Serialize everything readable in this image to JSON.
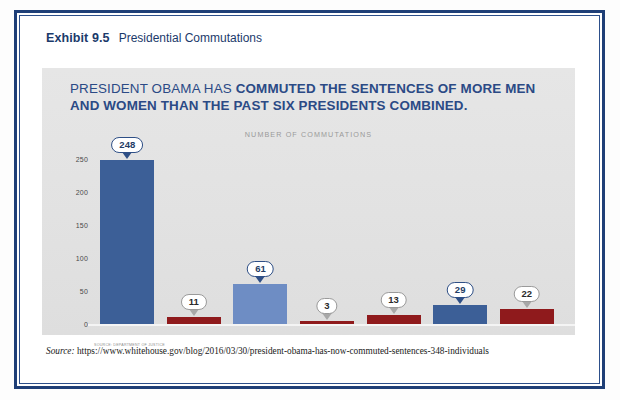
{
  "exhibit": {
    "label": "Exhibit 9.5",
    "title": "Presidential Commutations"
  },
  "headline": {
    "light_part": "PRESIDENT OBAMA HAS ",
    "bold_part": "COMMUTED THE SENTENCES OF MORE MEN AND WOMEN THAN THE PAST SIX PRESIDENTS COMBINED."
  },
  "footer": {
    "source_word": "Source:",
    "source_url": "https://www.whitehouse.gov/blog/2016/03/30/president-obama-has-now-commuted-sentences-348-individuals"
  },
  "colors": {
    "frame_navy": "#1f3f77",
    "headline_blue": "#2b4a85",
    "obama_blue": "#3c5f97",
    "clinton_blue": "#6e8dc4",
    "carter_blue": "#3c5f97",
    "republican_red": "#8f1a1c",
    "panel_gray": "#e4e4e4"
  },
  "chart_data": {
    "type": "bar",
    "title": "PRESIDENT OBAMA HAS COMMUTED THE SENTENCES OF MORE MEN AND WOMEN THAN THE PAST SIX PRESIDENTS COMBINED.",
    "subtitle": "NUMBER OF COMMUTATIONS",
    "source_note": "SOURCE: DEPARTMENT OF JUSTICE",
    "xlabel": "",
    "ylabel": "",
    "ylim": [
      0,
      260
    ],
    "yticks": [
      0,
      50,
      100,
      150,
      200,
      250
    ],
    "ytick_labels": [
      "0",
      "50",
      "100",
      "150",
      "200",
      "250"
    ],
    "grid": false,
    "legend": "none",
    "categories": [
      "OBAMA",
      "BUSH 43",
      "CLINTON",
      "BUSH 41",
      "REAGAN",
      "CARTER",
      "FORD"
    ],
    "values": [
      248,
      11,
      61,
      3,
      13,
      29,
      22
    ],
    "value_labels": [
      "248",
      "11",
      "61",
      "3",
      "13",
      "29",
      "22"
    ],
    "bar_colors": [
      "#3c5f97",
      "#8f1a1c",
      "#6e8dc4",
      "#8f1a1c",
      "#8f1a1c",
      "#3c5f97",
      "#8f1a1c"
    ],
    "label_colors": [
      "#2b4a85",
      "#8f1a1c",
      "#2b4a85",
      "#8f1a1c",
      "#8f1a1c",
      "#2b4a85",
      "#8f1a1c"
    ],
    "bubble_styles": [
      "blue",
      "gray",
      "blue",
      "gray",
      "gray",
      "blue",
      "gray"
    ]
  }
}
